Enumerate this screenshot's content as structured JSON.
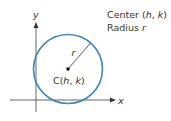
{
  "diagram": {
    "axes": {
      "x_label": "x",
      "y_label": "y"
    },
    "circle": {
      "center_label_prefix": "C(",
      "center_label_h": "h",
      "center_label_sep": ", ",
      "center_label_k": "k",
      "center_label_suffix": ")",
      "radius_label": "r",
      "stroke_color": "#3a86c0"
    },
    "legend": {
      "line1_prefix": "Center (",
      "line1_h": "h",
      "line1_sep": ", ",
      "line1_k": "k",
      "line1_suffix": ")",
      "line2_prefix": "Radius ",
      "line2_r": "r"
    },
    "colors": {
      "axis": "#555555",
      "circle": "#3a86c0",
      "text": "#333333"
    }
  }
}
